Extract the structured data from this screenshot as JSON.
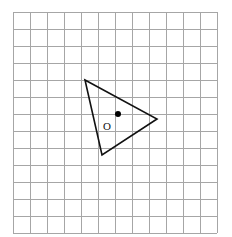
{
  "figure": {
    "title": "Grid with triangle, center of rotation and image point",
    "background_color": "#ffffff",
    "width": 232,
    "height": 237
  },
  "grid": {
    "name": "square-grid",
    "origin_x": 13,
    "origin_y": 12,
    "cell_size": 17,
    "columns": 12,
    "rows": 13,
    "line_color": "#a6a6a6",
    "line_width": 1
  },
  "shape": {
    "name": "triangle",
    "type": "polygon",
    "stroke_color": "#111111",
    "stroke_width": 1.6,
    "fill": "none",
    "vertices": [
      {
        "label": "top-left-vertex",
        "x": 85,
        "y": 80
      },
      {
        "label": "right-vertex",
        "x": 157,
        "y": 119
      },
      {
        "label": "bottom-vertex",
        "x": 102,
        "y": 155
      }
    ],
    "points_string": "85,80 157,119 102,155"
  },
  "markers": [
    {
      "name": "image-point-dot",
      "style": "filled",
      "x": 118,
      "y": 114,
      "radius": 3,
      "color": "#000000",
      "label": ""
    },
    {
      "name": "center-of-rotation-o",
      "style": "open",
      "x": 107,
      "y": 127,
      "radius": 4,
      "color": "#111111",
      "label": "O",
      "label_x": 107,
      "label_y": 127,
      "label_size": 11
    }
  ],
  "artifact": {
    "name": "top-edge-artifact",
    "visible": true,
    "left": 44,
    "top": 0,
    "width": 10,
    "height": 3,
    "color": "#b8b8b8"
  }
}
